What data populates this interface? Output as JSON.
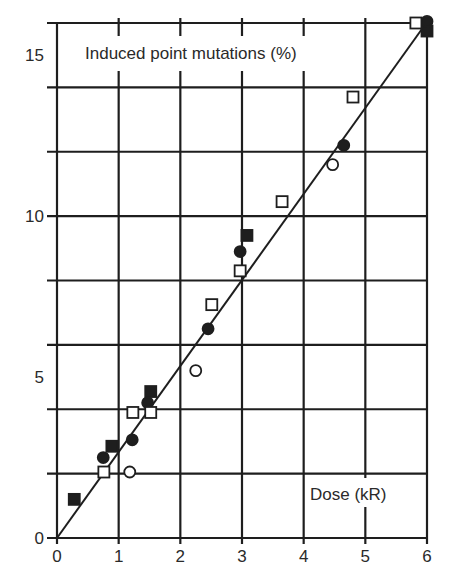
{
  "chart_data": {
    "type": "scatter",
    "title": "",
    "ylabel": "Induced point mutations (%)",
    "xlabel": "Dose (kR)",
    "xlim": [
      0,
      6
    ],
    "ylim": [
      0,
      16
    ],
    "x_ticks": [
      0,
      1,
      2,
      3,
      4,
      5,
      6
    ],
    "y_ticks": [
      0,
      5,
      10,
      15
    ],
    "x_gridlines": [
      0,
      1,
      2,
      3,
      4,
      5,
      6
    ],
    "y_gridlines": [
      0,
      2,
      4,
      6,
      8,
      10,
      12,
      14,
      16
    ],
    "grid": true,
    "legend": null,
    "series": [
      {
        "name": "filled squares",
        "marker": "square",
        "filled": true,
        "points": [
          [
            0.28,
            1.2
          ],
          [
            0.89,
            2.85
          ],
          [
            1.52,
            4.55
          ],
          [
            3.08,
            9.4
          ],
          [
            6.0,
            15.75
          ]
        ]
      },
      {
        "name": "filled circles",
        "marker": "circle",
        "filled": true,
        "points": [
          [
            0.75,
            2.5
          ],
          [
            1.22,
            3.05
          ],
          [
            1.47,
            4.2
          ],
          [
            2.45,
            6.5
          ],
          [
            2.97,
            8.9
          ],
          [
            4.65,
            12.2
          ],
          [
            6.0,
            16.05
          ]
        ]
      },
      {
        "name": "open squares",
        "marker": "square",
        "filled": false,
        "points": [
          [
            0.76,
            2.05
          ],
          [
            1.23,
            3.9
          ],
          [
            1.52,
            3.9
          ],
          [
            2.51,
            7.25
          ],
          [
            2.97,
            8.3
          ],
          [
            3.65,
            10.45
          ],
          [
            4.8,
            13.7
          ],
          [
            5.82,
            16.0
          ]
        ]
      },
      {
        "name": "open circles",
        "marker": "circle",
        "filled": false,
        "points": [
          [
            1.18,
            2.05
          ],
          [
            2.25,
            5.2
          ],
          [
            4.47,
            11.6
          ]
        ]
      }
    ],
    "fit_line": {
      "name": "linear fit",
      "from": [
        0,
        0
      ],
      "to": [
        5.95,
        15.9
      ]
    }
  },
  "labels": {
    "ylabel": "Induced point mutations (%)",
    "xlabel": "Dose (kR)"
  },
  "colors": {
    "ink": "#1e1e1e",
    "background": "#ffffff"
  }
}
